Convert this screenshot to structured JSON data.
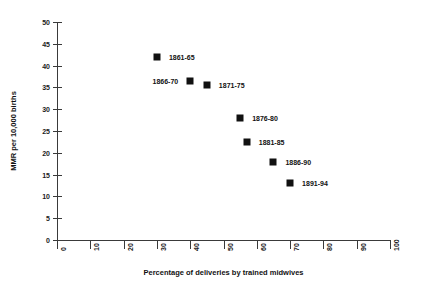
{
  "chart_data": {
    "type": "scatter",
    "title": "",
    "xlabel": "Percentage of deliveries by trained midwives",
    "ylabel": "MMR per 10,000 births",
    "xlim": [
      0,
      100
    ],
    "ylim": [
      0,
      50
    ],
    "xticks": [
      0,
      10,
      20,
      30,
      40,
      50,
      60,
      70,
      80,
      90,
      100
    ],
    "yticks": [
      0,
      5,
      10,
      15,
      20,
      25,
      30,
      35,
      40,
      45,
      50
    ],
    "grid": false,
    "legend": false,
    "marker_color": "#111111",
    "points": [
      {
        "label": "1861-65",
        "x": 30,
        "y": 42,
        "label_side": "right"
      },
      {
        "label": "1866-70",
        "x": 40,
        "y": 36.5,
        "label_side": "left"
      },
      {
        "label": "1871-75",
        "x": 45,
        "y": 35.5,
        "label_side": "right"
      },
      {
        "label": "1876-80",
        "x": 55,
        "y": 28,
        "label_side": "right"
      },
      {
        "label": "1881-85",
        "x": 57,
        "y": 22.5,
        "label_side": "right"
      },
      {
        "label": "1886-90",
        "x": 65,
        "y": 18,
        "label_side": "right"
      },
      {
        "label": "1891-94",
        "x": 70,
        "y": 13,
        "label_side": "right"
      }
    ]
  }
}
